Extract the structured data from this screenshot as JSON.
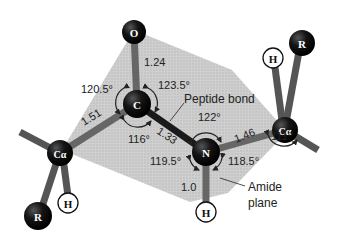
{
  "diagram": {
    "atoms": {
      "oxygen": "O",
      "carbonyl_carbon": "C",
      "nitrogen": "N",
      "alpha_carbon_left": "Cα",
      "alpha_carbon_right": "Cα",
      "r_group_left": "R",
      "r_group_right": "R",
      "hydrogen_left": "H",
      "hydrogen_right": "H",
      "hydrogen_amide": "H"
    },
    "bond_lengths": {
      "c_o": "1.24",
      "calpha_c": "1.51",
      "c_n": "1.33",
      "n_calpha": "1.46",
      "n_h": "1.0"
    },
    "bond_angles": {
      "calpha_c_o": "120.5°",
      "o_c_n": "123.5°",
      "calpha_c_n": "116°",
      "c_n_calpha": "122°",
      "c_n_h": "119.5°",
      "calpha_n_h": "118.5°",
      "n_calpha_c": "111°"
    },
    "annotations": {
      "peptide_bond": "Peptide bond",
      "amide_plane_line1": "Amide",
      "amide_plane_line2": "plane"
    },
    "colors": {
      "plane": "#c8c8c8",
      "atom": "#111111",
      "bond": "#555555",
      "hydrogen_fill": "#ffffff"
    }
  }
}
